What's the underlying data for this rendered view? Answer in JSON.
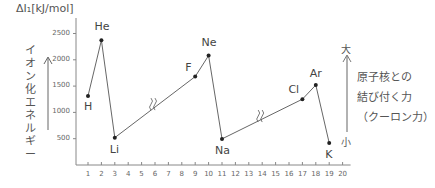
{
  "chart_data": {
    "type": "line",
    "title": "",
    "ylabel": "ΔI₁[kJ/mol]",
    "xlabel": "",
    "ylim": [
      0,
      2500
    ],
    "xlim": [
      0,
      20
    ],
    "y_ticks": [
      "2500",
      "2000",
      "1500",
      "1000",
      "500"
    ],
    "x_ticks": [
      "1",
      "2",
      "3",
      "4",
      "5",
      "6",
      "7",
      "8",
      "9",
      "10",
      "11",
      "12",
      "13",
      "14",
      "15",
      "16",
      "17",
      "18",
      "19",
      "20"
    ],
    "grid": false,
    "series": [
      {
        "name": "first ionization energy",
        "points": [
          {
            "element": "H",
            "x": 1,
            "y": 1312
          },
          {
            "element": "He",
            "x": 2,
            "y": 2372
          },
          {
            "element": "Li",
            "x": 3,
            "y": 520
          },
          {
            "element": "F",
            "x": 9,
            "y": 1681
          },
          {
            "element": "Ne",
            "x": 10,
            "y": 2081
          },
          {
            "element": "Na",
            "x": 11,
            "y": 496
          },
          {
            "element": "Cl",
            "x": 17,
            "y": 1251
          },
          {
            "element": "Ar",
            "x": 18,
            "y": 1521
          },
          {
            "element": "K",
            "x": 19,
            "y": 419
          }
        ]
      }
    ],
    "annotations": {
      "left_vertical": "イオン化エネルギー",
      "right_big": "大",
      "right_small": "小",
      "right_note": [
        "原子核との",
        "結び付く力",
        "（クーロン力）"
      ],
      "axis_break_marks": [
        "between 3 and 9",
        "between 11 and 17"
      ]
    }
  },
  "labels": {
    "ytitle": "ΔI₁[kJ/mol]",
    "left_vertical": [
      "イ",
      "オ",
      "ン",
      "化",
      "エ",
      "ネ",
      "ル",
      "ギ",
      "ー"
    ],
    "big": "大",
    "small": "小",
    "note1": "原子核との",
    "note2": "結び付く力",
    "note3": "（クーロン力）"
  }
}
